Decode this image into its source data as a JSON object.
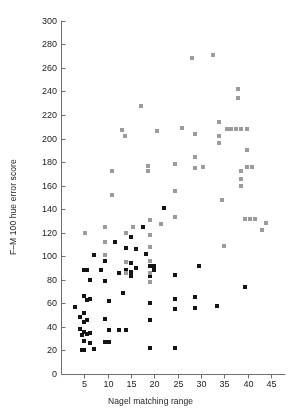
{
  "chart_data": {
    "type": "scatter",
    "title": "",
    "xlabel": "Nagel matching range",
    "ylabel": "F–M 100 hue error score",
    "xlim": [
      0,
      48
    ],
    "ylim": [
      0,
      300
    ],
    "xticks": [
      5,
      10,
      15,
      20,
      25,
      30,
      35,
      40,
      45
    ],
    "yticks": [
      0,
      20,
      40,
      60,
      80,
      100,
      120,
      140,
      160,
      180,
      200,
      220,
      240,
      260,
      280,
      300
    ],
    "grid": false,
    "legend": "none",
    "marker": "square",
    "series": [
      {
        "name": "dark-markers",
        "color": "#141414",
        "points": [
          [
            3,
            57
          ],
          [
            4,
            48
          ],
          [
            4,
            38
          ],
          [
            4.4,
            33
          ],
          [
            4.6,
            20
          ],
          [
            5,
            88
          ],
          [
            5,
            66
          ],
          [
            5,
            52
          ],
          [
            5,
            44
          ],
          [
            5,
            36
          ],
          [
            5,
            28
          ],
          [
            5,
            20
          ],
          [
            5.6,
            88
          ],
          [
            5.6,
            63
          ],
          [
            5.6,
            46
          ],
          [
            5.6,
            34
          ],
          [
            6.3,
            80
          ],
          [
            6.3,
            64
          ],
          [
            6.3,
            35
          ],
          [
            6.3,
            26
          ],
          [
            7,
            101
          ],
          [
            7,
            21
          ],
          [
            8.6,
            88
          ],
          [
            9.5,
            96
          ],
          [
            9.5,
            79
          ],
          [
            9.5,
            47
          ],
          [
            9.5,
            27
          ],
          [
            10.2,
            62
          ],
          [
            10.2,
            37
          ],
          [
            10.2,
            27
          ],
          [
            11.6,
            112
          ],
          [
            12.5,
            86
          ],
          [
            12.5,
            37
          ],
          [
            13.3,
            69
          ],
          [
            14,
            107
          ],
          [
            14,
            88
          ],
          [
            14,
            37
          ],
          [
            15,
            116
          ],
          [
            15,
            94
          ],
          [
            15,
            87
          ],
          [
            15,
            83
          ],
          [
            16,
            106
          ],
          [
            16,
            90
          ],
          [
            17.5,
            125
          ],
          [
            18.2,
            102
          ],
          [
            19,
            92
          ],
          [
            19,
            86
          ],
          [
            19,
            83
          ],
          [
            19,
            60
          ],
          [
            19,
            46
          ],
          [
            19,
            22
          ],
          [
            20,
            92
          ],
          [
            20,
            88
          ],
          [
            22,
            141
          ],
          [
            24.5,
            84
          ],
          [
            24.5,
            64
          ],
          [
            24.5,
            55
          ],
          [
            24.5,
            22
          ],
          [
            28.7,
            65
          ],
          [
            28.7,
            56
          ],
          [
            29.5,
            92
          ],
          [
            33.5,
            58
          ],
          [
            39.5,
            74
          ]
        ]
      },
      {
        "name": "light-markers",
        "color": "#9b9b9b",
        "points": [
          [
            5.2,
            120
          ],
          [
            9.5,
            125
          ],
          [
            9.5,
            112
          ],
          [
            9.5,
            101
          ],
          [
            11,
            172
          ],
          [
            11,
            152
          ],
          [
            13,
            207
          ],
          [
            13.6,
            202
          ],
          [
            14,
            120
          ],
          [
            14,
            95
          ],
          [
            14,
            86
          ],
          [
            15.5,
            125
          ],
          [
            17.2,
            228
          ],
          [
            18.6,
            177
          ],
          [
            18.6,
            172
          ],
          [
            19,
            131
          ],
          [
            19,
            118
          ],
          [
            19,
            108
          ],
          [
            19,
            96
          ],
          [
            19,
            86
          ],
          [
            19,
            78
          ],
          [
            20.5,
            206
          ],
          [
            21.5,
            127
          ],
          [
            24.5,
            178
          ],
          [
            24.5,
            155
          ],
          [
            24.5,
            133
          ],
          [
            26,
            209
          ],
          [
            28,
            268
          ],
          [
            28.8,
            204
          ],
          [
            28.8,
            184
          ],
          [
            28.8,
            175
          ],
          [
            30.5,
            176
          ],
          [
            32.5,
            271
          ],
          [
            33.8,
            214
          ],
          [
            33.8,
            202
          ],
          [
            33.8,
            196
          ],
          [
            34.5,
            148
          ],
          [
            35,
            109
          ],
          [
            35.5,
            208
          ],
          [
            36.5,
            208
          ],
          [
            37.5,
            208
          ],
          [
            38.5,
            208
          ],
          [
            38,
            242
          ],
          [
            38,
            234
          ],
          [
            38.5,
            172
          ],
          [
            38.5,
            166
          ],
          [
            38.5,
            160
          ],
          [
            39.5,
            132
          ],
          [
            40.5,
            132
          ],
          [
            41.5,
            132
          ],
          [
            39.8,
            208
          ],
          [
            39.8,
            190
          ],
          [
            39.8,
            176
          ],
          [
            43,
            122
          ],
          [
            44,
            128
          ],
          [
            41,
            176
          ]
        ]
      }
    ]
  },
  "axis": {
    "x_tick_labels": [
      "5",
      "10",
      "15",
      "20",
      "25",
      "30",
      "35",
      "40",
      "45"
    ],
    "y_tick_labels": [
      "0",
      "20",
      "40",
      "60",
      "80",
      "100",
      "120",
      "140",
      "160",
      "180",
      "200",
      "220",
      "240",
      "260",
      "280",
      "300"
    ]
  },
  "colors": {
    "axis": "#6e6e6e",
    "text": "#1a1a1a",
    "dark_marker": "#141414",
    "light_marker": "#9b9b9b",
    "background": "#ffffff"
  }
}
